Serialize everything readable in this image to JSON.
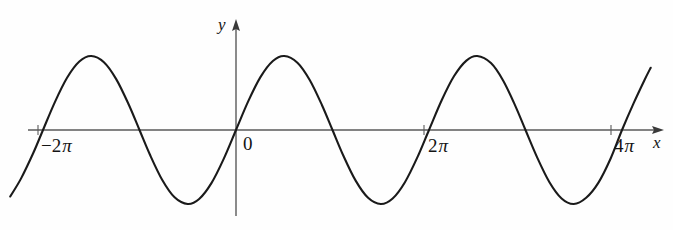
{
  "figure": {
    "name": "sine-wave-graph",
    "background_color": "#fefefe",
    "curve_color": "#1a1a1a",
    "axis_color": "#555555"
  },
  "axes": {
    "x_axis_label": "x",
    "y_axis_label": "y",
    "origin_label": "0",
    "x_axis_name": "x-axis",
    "y_axis_name": "y-axis"
  },
  "ticks": {
    "x": [
      {
        "label_number": "−2",
        "label_symbol": "π",
        "value": -6.283185,
        "px": 38
      },
      {
        "label_number": "2",
        "label_symbol": "π",
        "value": 6.283185,
        "px": 424
      },
      {
        "label_number": "4",
        "label_symbol": "π",
        "value": 12.566371,
        "px": 611
      }
    ]
  },
  "chart_data": {
    "type": "line",
    "title": "",
    "subtitle": "",
    "xlabel": "x",
    "ylabel": "y",
    "function": "y = sin(x)",
    "amplitude": 1,
    "period": "2π",
    "phase": 0,
    "xlim": [
      -7.35,
      13.5
    ],
    "ylim": [
      -1.22,
      1.22
    ],
    "grid": false,
    "legend": null,
    "xticks": [
      -6.283185,
      6.283185,
      12.566371
    ],
    "xticklabels": [
      "−2π",
      "2π",
      "4π"
    ],
    "yticks": [],
    "yticklabels": [],
    "zero_crossings": [
      -6.283185,
      -3.141593,
      0,
      3.141593,
      6.283185,
      9.424778,
      12.566371
    ],
    "maxima": [
      {
        "x": -4.712389,
        "y": 1
      },
      {
        "x": 1.570796,
        "y": 1
      },
      {
        "x": 7.853982,
        "y": 1
      }
    ],
    "minima": [
      {
        "x": -1.570796,
        "y": -1
      },
      {
        "x": 4.712389,
        "y": -1
      },
      {
        "x": 10.995574,
        "y": -1
      }
    ],
    "series": [
      {
        "name": "sin(x)",
        "x": [
          -7.35,
          -7.0,
          -6.6,
          -6.283185,
          -5.9,
          -5.5,
          -5.1,
          -4.712389,
          -4.3,
          -3.9,
          -3.5,
          -3.141593,
          -2.8,
          -2.4,
          -2.0,
          -1.570796,
          -1.2,
          -0.8,
          -0.4,
          0,
          0.4,
          0.8,
          1.2,
          1.570796,
          2.0,
          2.4,
          2.8,
          3.141593,
          3.5,
          3.9,
          4.3,
          4.712389,
          5.1,
          5.5,
          5.9,
          6.283185,
          6.7,
          7.1,
          7.5,
          7.853982,
          8.3,
          8.7,
          9.1,
          9.424778,
          9.8,
          10.2,
          10.6,
          10.995574,
          11.4,
          11.8,
          12.2,
          12.566371,
          12.95,
          13.3,
          13.5
        ],
        "y": [
          -0.8987,
          -0.657,
          -0.3115,
          0,
          0.3739,
          0.7055,
          0.9258,
          1.0,
          0.9162,
          0.6878,
          0.3508,
          0,
          -0.335,
          -0.6755,
          -0.9093,
          -1.0,
          -0.932,
          -0.7174,
          -0.3894,
          0,
          0.3894,
          0.7174,
          0.932,
          1.0,
          0.9093,
          0.6755,
          0.335,
          0,
          -0.3508,
          -0.6878,
          -0.9162,
          -1.0,
          -0.9258,
          -0.7055,
          -0.3739,
          0,
          0.4048,
          0.7289,
          0.938,
          1.0,
          0.9045,
          0.6663,
          0.3199,
          0,
          -0.366,
          -0.7017,
          -0.9249,
          -1.0,
          -0.9162,
          -0.7118,
          -0.3821,
          0,
          0.3665,
          0.6761,
          0.8415
        ]
      }
    ]
  }
}
